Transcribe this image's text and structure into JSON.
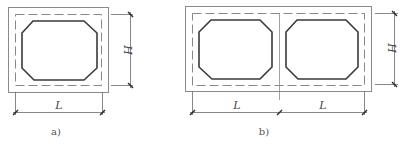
{
  "figure_a": {
    "caption": "a)",
    "dim_width_label": "L",
    "dim_height_label": "H",
    "cells": 1
  },
  "figure_b": {
    "caption": "b)",
    "dim_width_labels": [
      "L",
      "L"
    ],
    "dim_height_label": "H",
    "cells": 2
  },
  "colors": {
    "outline": "#8a8a8a",
    "opening": "#3a3a3a",
    "dimension": "#6a6a6a"
  }
}
